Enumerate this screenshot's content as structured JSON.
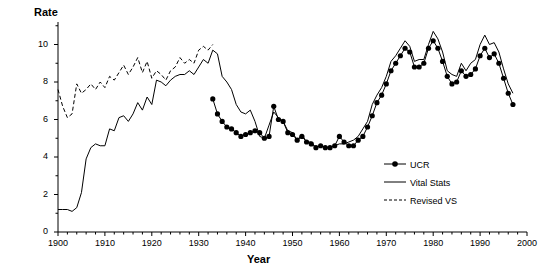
{
  "chart_data": {
    "type": "line",
    "title": "",
    "xlabel": "Year",
    "ylabel": "Rate",
    "xlim": [
      1900,
      2000
    ],
    "ylim": [
      0,
      11.2
    ],
    "xticks": [
      1900,
      1910,
      1920,
      1930,
      1940,
      1950,
      1960,
      1970,
      1980,
      1990,
      2000
    ],
    "yticks": [
      0,
      2,
      4,
      6,
      8,
      10
    ],
    "grid": false,
    "legend_position": "bottom-right",
    "legend": [
      "UCR",
      "Vital Stats",
      "Revised VS"
    ],
    "series": [
      {
        "name": "UCR",
        "style": "line-with-filled-circle-markers",
        "x": [
          1933,
          1934,
          1935,
          1936,
          1937,
          1938,
          1939,
          1940,
          1941,
          1942,
          1943,
          1944,
          1945,
          1946,
          1947,
          1948,
          1949,
          1950,
          1951,
          1952,
          1953,
          1954,
          1955,
          1956,
          1957,
          1958,
          1959,
          1960,
          1961,
          1962,
          1963,
          1964,
          1965,
          1966,
          1967,
          1968,
          1969,
          1970,
          1971,
          1972,
          1973,
          1974,
          1975,
          1976,
          1977,
          1978,
          1979,
          1980,
          1981,
          1982,
          1983,
          1984,
          1985,
          1986,
          1987,
          1988,
          1989,
          1990,
          1991,
          1992,
          1993,
          1994,
          1995,
          1996,
          1997
        ],
        "y": [
          7.1,
          6.3,
          5.9,
          5.6,
          5.5,
          5.3,
          5.1,
          5.2,
          5.3,
          5.4,
          5.3,
          5.0,
          5.1,
          6.7,
          6.0,
          5.9,
          5.3,
          5.2,
          4.9,
          5.1,
          4.8,
          4.7,
          4.5,
          4.6,
          4.5,
          4.5,
          4.6,
          5.1,
          4.8,
          4.6,
          4.6,
          4.9,
          5.1,
          5.6,
          6.2,
          6.9,
          7.3,
          7.9,
          8.6,
          9.0,
          9.4,
          9.8,
          9.6,
          8.8,
          8.8,
          9.0,
          9.8,
          10.2,
          9.8,
          9.1,
          8.3,
          7.9,
          8.0,
          8.6,
          8.3,
          8.4,
          8.7,
          9.4,
          9.8,
          9.3,
          9.5,
          9.0,
          8.2,
          7.4,
          6.8
        ]
      },
      {
        "name": "Vital Stats",
        "style": "thin-solid-line",
        "x": [
          1900,
          1901,
          1902,
          1903,
          1904,
          1905,
          1906,
          1907,
          1908,
          1909,
          1910,
          1911,
          1912,
          1913,
          1914,
          1915,
          1916,
          1917,
          1918,
          1919,
          1920,
          1921,
          1922,
          1923,
          1924,
          1925,
          1926,
          1927,
          1928,
          1929,
          1930,
          1931,
          1932,
          1933,
          1934,
          1935,
          1936,
          1937,
          1938,
          1939,
          1940,
          1941,
          1942,
          1943,
          1944,
          1945,
          1946,
          1947,
          1948,
          1949,
          1950,
          1951,
          1952,
          1953,
          1954,
          1955,
          1956,
          1957,
          1958,
          1959,
          1960,
          1961,
          1962,
          1963,
          1964,
          1965,
          1966,
          1967,
          1968,
          1969,
          1970,
          1971,
          1972,
          1973,
          1974,
          1975,
          1976,
          1977,
          1978,
          1979,
          1980,
          1981,
          1982,
          1983,
          1984,
          1985,
          1986,
          1987,
          1988,
          1989,
          1990,
          1991,
          1992,
          1993,
          1994,
          1995,
          1996,
          1997
        ],
        "y": [
          1.2,
          1.2,
          1.2,
          1.1,
          1.3,
          2.1,
          3.9,
          4.5,
          4.7,
          4.6,
          4.6,
          5.5,
          5.4,
          6.1,
          6.2,
          5.9,
          6.3,
          6.9,
          6.5,
          7.2,
          6.8,
          8.1,
          8.0,
          7.8,
          8.1,
          8.3,
          8.4,
          8.4,
          8.6,
          8.4,
          8.8,
          9.2,
          9.0,
          9.7,
          9.5,
          8.3,
          8.0,
          7.6,
          6.8,
          6.4,
          6.3,
          6.5,
          5.9,
          5.1,
          5.0,
          5.7,
          6.4,
          6.1,
          5.9,
          5.4,
          5.3,
          4.9,
          5.2,
          4.8,
          4.8,
          4.5,
          4.6,
          4.5,
          4.5,
          4.6,
          4.7,
          4.7,
          4.8,
          4.9,
          5.1,
          5.5,
          5.9,
          6.8,
          7.3,
          7.7,
          8.3,
          9.1,
          9.4,
          9.8,
          10.2,
          9.9,
          9.1,
          9.2,
          9.2,
          10.0,
          10.7,
          10.3,
          9.6,
          8.6,
          8.4,
          8.3,
          9.0,
          8.6,
          9.0,
          9.2,
          10.0,
          10.5,
          10.0,
          10.1,
          9.6,
          8.7,
          7.9,
          7.4
        ]
      },
      {
        "name": "Revised VS",
        "style": "dashed-line",
        "x": [
          1900,
          1901,
          1902,
          1903,
          1904,
          1905,
          1906,
          1907,
          1908,
          1909,
          1910,
          1911,
          1912,
          1913,
          1914,
          1915,
          1916,
          1917,
          1918,
          1919,
          1920,
          1921,
          1922,
          1923,
          1924,
          1925,
          1926,
          1927,
          1928,
          1929,
          1930,
          1931,
          1932,
          1933
        ],
        "y": [
          7.6,
          6.7,
          6.1,
          6.3,
          7.9,
          7.4,
          7.6,
          7.9,
          7.6,
          8.0,
          7.7,
          8.3,
          8.1,
          8.5,
          8.9,
          8.4,
          8.8,
          9.3,
          8.5,
          9.1,
          8.2,
          8.6,
          8.4,
          8.1,
          8.6,
          8.8,
          9.3,
          9.0,
          9.2,
          9.0,
          9.7,
          9.9,
          9.7,
          10.0
        ]
      }
    ]
  }
}
